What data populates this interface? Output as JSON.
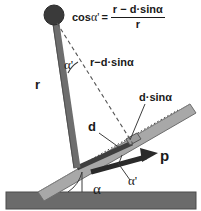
{
  "figure": {
    "background_color": "#ffffff",
    "colors": {
      "ball": "#3a3a3a",
      "rod": "#6e6e6e",
      "plank": "#a8a8a8",
      "ground": "#6b6b6b",
      "ink": "#1a1a1a",
      "dash": "#555555"
    }
  },
  "formula": {
    "lhs": "cos",
    "lhs_angle": "α'",
    "equals": "=",
    "numerator": "r − d·sinα",
    "denominator": "r"
  },
  "labels": {
    "r": "r",
    "alpha_prime_top": "α'",
    "r_minus_dsina": "r−d·sinα",
    "d_sin_alpha": "d·sinα",
    "d": "d",
    "p": "p",
    "alpha_prime_bottom": "α'",
    "alpha_bottom": "α"
  },
  "elements": {
    "ball": "pendulum-bob",
    "rod": "pendulum-rod",
    "plank": "inclined-plank",
    "ground": "ground-surface",
    "p_arrow": "momentum-vector-p",
    "d_segment": "offset-segment-d",
    "dashed_r_prime": "dashed-effective-radius-line",
    "dotted_plank_axis": "dotted-plank-axis-line",
    "angle_arc_top": "angle-arc-alpha-prime-top",
    "angle_arc_bottom_incline": "angle-arc-alpha-incline",
    "angle_arc_p": "angle-arc-alpha-prime-p"
  }
}
